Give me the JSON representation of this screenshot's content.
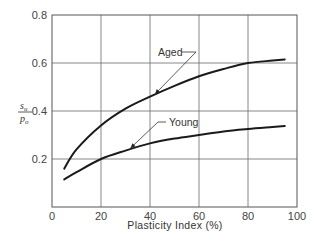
{
  "chart_data": {
    "type": "line",
    "title": "",
    "xlabel": "Plasticity Index (%)",
    "ylabel": "s_u / p_o",
    "ylabel_parts": {
      "numerator": "s",
      "numerator_sub": "u",
      "denominator": "p",
      "denominator_sub": "o"
    },
    "xlim": [
      0,
      100
    ],
    "ylim": [
      0,
      0.8
    ],
    "grid": true,
    "legend_position": "inline annotations with leader arrows",
    "x_ticks": [
      0,
      20,
      40,
      60,
      80,
      100
    ],
    "x_tick_labels": [
      "0",
      "20",
      "40",
      "60",
      "80",
      "100"
    ],
    "y_ticks": [
      0.2,
      0.4,
      0.6,
      0.8
    ],
    "y_tick_labels": [
      "0.2",
      "0.4",
      "0.6",
      "0.8"
    ],
    "series": [
      {
        "name": "Aged",
        "x": [
          5,
          10,
          20,
          30,
          40,
          50,
          60,
          70,
          80,
          90,
          95
        ],
        "values": [
          0.16,
          0.24,
          0.34,
          0.41,
          0.46,
          0.505,
          0.545,
          0.575,
          0.6,
          0.61,
          0.615
        ],
        "color": "#1a1a1a"
      },
      {
        "name": "Young",
        "x": [
          5,
          10,
          20,
          30,
          40,
          50,
          60,
          70,
          80,
          90,
          95
        ],
        "values": [
          0.115,
          0.145,
          0.2,
          0.235,
          0.265,
          0.285,
          0.3,
          0.315,
          0.325,
          0.333,
          0.337
        ],
        "color": "#1a1a1a"
      }
    ],
    "annotations": [
      {
        "text": "Aged",
        "points_to_x": 42,
        "points_to_y": 0.47
      },
      {
        "text": "Young",
        "points_to_x": 32,
        "points_to_y": 0.245
      }
    ]
  }
}
